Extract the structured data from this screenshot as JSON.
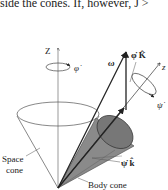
{
  "caption_fragment": "side the cones. If, however, J >",
  "diagram": {
    "labels": {
      "space_axis": "Z",
      "space_rotation": "φ̇",
      "omega": "ω",
      "precession_vector": "φ̇ K̂",
      "body_axis": "z",
      "spin_rotation": "ψ̇",
      "spin_vector": "ψ̇ k̂",
      "space_cone": [
        "Space",
        "cone"
      ],
      "body_cone": "Body cone"
    },
    "colors": {
      "line": "#333333",
      "body_cone_fill": "#8a8a8a",
      "body_cone_top": "#6e6e6e",
      "background": "#ffffff"
    }
  }
}
